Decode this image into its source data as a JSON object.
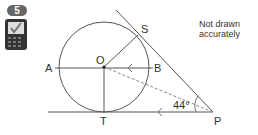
{
  "question": {
    "number": "5",
    "calculator_icon": "calculator-allowed-icon"
  },
  "note": {
    "line1": "Not drawn",
    "line2": "accurately"
  },
  "diagram": {
    "points": {
      "O": "O",
      "A": "A",
      "B": "B",
      "S": "S",
      "T": "T",
      "P": "P"
    },
    "angle_label": "44°",
    "colors": {
      "line": "#555555",
      "dashed": "#888888"
    }
  }
}
